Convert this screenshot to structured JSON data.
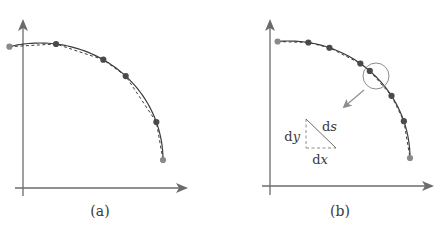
{
  "figure": {
    "panels": [
      {
        "id": "a",
        "caption": "(a)",
        "description": "Polyline through sample points (dashed) approximating a smooth curve (solid)",
        "sample_point_count": 6
      },
      {
        "id": "b",
        "caption": "(b)",
        "description": "Denser sample points along curve; magnified circle shows arc-length element",
        "sample_point_count": 8,
        "inset": {
          "dy_label": "d",
          "dy_var": "y",
          "ds_label": "d",
          "ds_var": "s",
          "dx_label": "d",
          "dx_var": "x"
        }
      }
    ],
    "colors": {
      "axis": "#6b6b6b",
      "curve": "#3c3c3c",
      "point": "#4a4a4a",
      "point_light": "#8a8a8a",
      "inset": "#8c8c8c"
    }
  }
}
